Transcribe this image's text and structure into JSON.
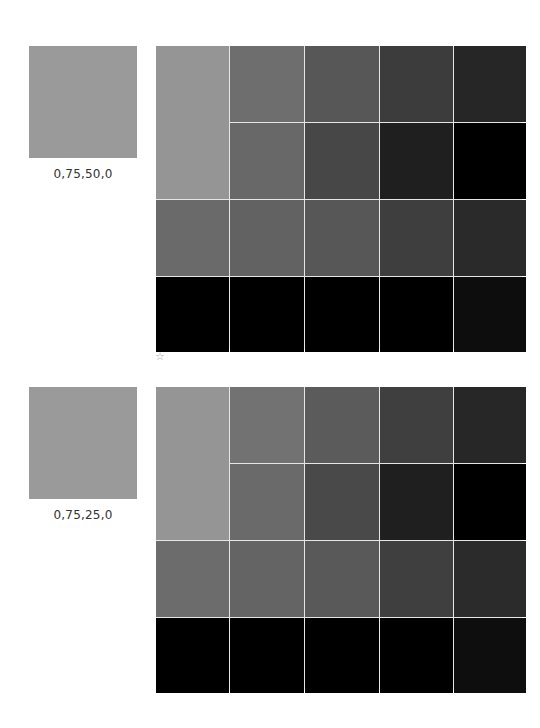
{
  "sections": [
    {
      "swatch_label": "0,75,50,0",
      "swatch_color": "#9a9a9a",
      "grid": {
        "big_cell": "#959595",
        "cells": [
          [
            "#6e6e6e",
            "#575757",
            "#3c3c3c",
            "#262626"
          ],
          [
            "#686868",
            "#474747",
            "#1f1f1f",
            "#000000"
          ],
          [
            "#6a6a6a",
            "#626262",
            "#575757",
            "#3e3e3e",
            "#2a2a2a"
          ],
          [
            "#000000",
            "#000000",
            "#000000",
            "#000000",
            "#0d0d0d"
          ]
        ]
      },
      "marker": "☆"
    },
    {
      "swatch_label": "0,75,25,0",
      "swatch_color": "#9a9a9a",
      "grid": {
        "big_cell": "#959595",
        "cells": [
          [
            "#727272",
            "#5b5b5b",
            "#3f3f3f",
            "#272727"
          ],
          [
            "#6a6a6a",
            "#494949",
            "#1f1f1f",
            "#000000"
          ],
          [
            "#6c6c6c",
            "#646464",
            "#595959",
            "#3f3f3f",
            "#2b2b2b"
          ],
          [
            "#000000",
            "#000000",
            "#000000",
            "#000000",
            "#0e0e0e"
          ]
        ]
      }
    }
  ]
}
